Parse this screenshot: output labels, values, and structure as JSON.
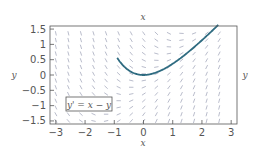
{
  "chart_data": {
    "type": "line",
    "title": "",
    "top_label": "x",
    "xlabel": "x",
    "ylabel": "y",
    "right_label": "y",
    "xlim": [
      -3.2,
      3.2
    ],
    "ylim": [
      -1.6,
      1.6
    ],
    "xticks": [
      -3,
      -2,
      -1,
      0,
      1,
      2,
      3
    ],
    "xtick_labels": [
      "−3",
      "−2",
      "−1",
      "0",
      "1",
      "2",
      "3"
    ],
    "yticks": [
      1.5,
      1,
      0.5,
      0,
      -0.5,
      -1,
      -1.5
    ],
    "ytick_labels": [
      "1.5",
      "1",
      "0.5",
      "0",
      "−0.5",
      "−1",
      "−1.5"
    ],
    "annotation": "y' = x − y",
    "grid": false,
    "background": "slope field of y' = x − y",
    "series": [
      {
        "name": "solution curve y = x − 1 + e^(−x)",
        "color": "#2e6b80",
        "x": [
          -0.85,
          -0.75,
          -0.5,
          -0.25,
          0,
          0.5,
          1,
          1.5,
          2,
          2.5,
          2.8
        ],
        "y": [
          1.49,
          1.37,
          0.15,
          0.03,
          0,
          0.11,
          0.37,
          0.72,
          1.14,
          1.58,
          1.86
        ]
      }
    ]
  }
}
